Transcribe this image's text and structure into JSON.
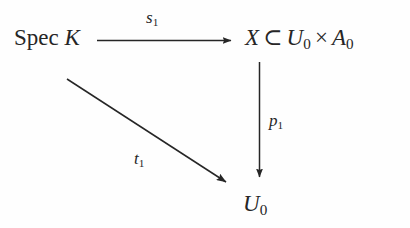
{
  "diagram": {
    "kind": "commutative-diagram",
    "background_color": "#fefefe",
    "ink_color": "#262626",
    "width": 410,
    "height": 228,
    "nodes": {
      "top_left": {
        "name": "spec-k",
        "operator": "Spec",
        "space": " ",
        "variable": "K",
        "plain_text": "Spec K"
      },
      "top_right": {
        "name": "x-in-u0-times-a0",
        "x_symbol": "X",
        "subset_symbol": "⊂",
        "u_symbol": "U",
        "u_subscript": "0",
        "times_symbol": "×",
        "a_symbol": "A",
        "a_subscript": "0",
        "plain_text": "X ⊂ U₀ × A₀"
      },
      "bottom": {
        "name": "u0",
        "symbol": "U",
        "subscript": "0",
        "plain_text": "U₀"
      }
    },
    "arrows": {
      "horizontal": {
        "name": "arrow-s1",
        "from": "spec-k",
        "to": "x-in-u0-times-a0",
        "label_symbol": "s",
        "label_subscript": "1",
        "label_plain_text": "s₁",
        "direction": "right"
      },
      "vertical": {
        "name": "arrow-p1",
        "from": "x-in-u0-times-a0",
        "to": "u0",
        "label_symbol": "p",
        "label_subscript": "1",
        "label_plain_text": "p₁",
        "direction": "down"
      },
      "diagonal": {
        "name": "arrow-t1",
        "from": "spec-k",
        "to": "u0",
        "label_symbol": "t",
        "label_subscript": "1",
        "label_plain_text": "t₁",
        "direction": "down-right"
      }
    }
  }
}
